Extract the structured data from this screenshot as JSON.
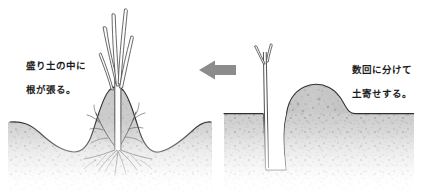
{
  "figure": {
    "width": 424,
    "height": 194,
    "background_color": "#ffffff"
  },
  "captions": {
    "left": "盛り土の中に\n根が張る。",
    "left_line1": "盛り土の中に",
    "left_line2": "根が張る。",
    "right": "数回に分けて\n土寄せする。",
    "right_line1": "数回に分けて",
    "right_line2": "土寄せする。",
    "text_color": "#1c1c1c"
  },
  "arrow": {
    "name": "left-arrow",
    "direction": "left",
    "color": "#8c8c8c",
    "x": 198,
    "y": 62,
    "width": 38,
    "height": 16
  },
  "panels": [
    {
      "id": "left-panel",
      "name": "mound-cross-section",
      "description": "完成した盛り土の断面。中央の高い盛り土にネギが植わり、根が盛り土の中に広がる。両側は谷状にくぼんだ地面。",
      "soil_fill": "#c9c9c9",
      "soil_outline": "#3a3a3a",
      "plant": "ネギ",
      "leaf_count": 5,
      "has_roots": true
    },
    {
      "id": "right-panel",
      "name": "trench-cross-section",
      "description": "溝を掘ってネギを植え、溝の脇に土を寄せた断面。",
      "soil_fill": "#c9c9c9",
      "soil_outline": "#3a3a3a",
      "plant": "ネギ",
      "leaf_count": 2,
      "has_trench": true,
      "has_side_mound": true
    }
  ],
  "colors": {
    "soil_light": "#d8d8d8",
    "soil_mid": "#c5c5c5",
    "soil_dark": "#a8a8a8",
    "outline": "#3a3a3a",
    "ground_line": "#2e2e2e",
    "arrow_gray": "#8c8c8c",
    "root_color": "#4a4a4a",
    "leaf_outline": "#555555",
    "white": "#ffffff"
  }
}
